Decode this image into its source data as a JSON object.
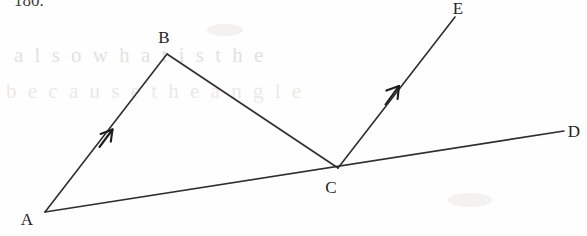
{
  "page": {
    "width": 587,
    "height": 236,
    "background_color": "#fefefe",
    "ink_color": "#2e2e2e",
    "label_color": "#242424"
  },
  "problem_number": {
    "text": "180.",
    "x": 14,
    "y": 6,
    "clipped_at_top": true
  },
  "diagram": {
    "type": "geometry-figure",
    "points": [
      {
        "name": "A",
        "x": 45,
        "y": 212,
        "label_x": 27,
        "label_y": 225
      },
      {
        "name": "B",
        "x": 167,
        "y": 54,
        "label_x": 163,
        "label_y": 43
      },
      {
        "name": "C",
        "x": 338,
        "y": 168,
        "label_x": 330,
        "label_y": 192
      },
      {
        "name": "D",
        "x": 564,
        "y": 131,
        "label_x": 574,
        "label_y": 136
      },
      {
        "name": "E",
        "x": 455,
        "y": 17,
        "label_x": 456,
        "label_y": 13
      }
    ],
    "segments": [
      {
        "name": "AB",
        "from": "A",
        "to": "B",
        "arrow": true,
        "arrow_at_fraction": 0.41
      },
      {
        "name": "BC",
        "from": "B",
        "to": "C",
        "arrow": false
      },
      {
        "name": "AD",
        "from": "A",
        "to": "D",
        "arrow": false
      },
      {
        "name": "CE",
        "from": "C",
        "to": "E",
        "arrow": true,
        "arrow_at_fraction": 0.52
      }
    ],
    "labels": [
      "A",
      "B",
      "C",
      "D",
      "E"
    ]
  },
  "background_bleed": {
    "row1": "a l s o   w h a t   i s   t h e",
    "row2": "b e c a u s e   t h e   a n g l e"
  }
}
